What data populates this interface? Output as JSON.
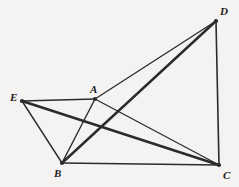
{
  "figure": {
    "canvas": {
      "width": 239,
      "height": 187
    },
    "background_color": "#f4f3f1",
    "stroke_color": "#2b2b2b",
    "label_color": "#1b1b1b",
    "points": [
      {
        "id": "A",
        "label": "A",
        "x": 95,
        "y": 99,
        "label_x": 90,
        "label_y": 84
      },
      {
        "id": "B",
        "label": "B",
        "x": 62,
        "y": 163,
        "label_x": 54,
        "label_y": 168
      },
      {
        "id": "C",
        "label": "C",
        "x": 219,
        "y": 165,
        "label_x": 223,
        "label_y": 170
      },
      {
        "id": "D",
        "label": "D",
        "x": 216,
        "y": 21,
        "label_x": 220,
        "label_y": 6
      },
      {
        "id": "E",
        "label": "E",
        "x": 22,
        "y": 101,
        "label_x": 10,
        "label_y": 92
      }
    ],
    "segments": [
      {
        "id": "EA",
        "from": "E",
        "to": "A",
        "width": 1.6
      },
      {
        "id": "EB",
        "from": "E",
        "to": "B",
        "width": 1.4
      },
      {
        "id": "EC",
        "from": "E",
        "to": "C",
        "width": 2.6
      },
      {
        "id": "AB",
        "from": "A",
        "to": "B",
        "width": 1.4
      },
      {
        "id": "AC",
        "from": "A",
        "to": "C",
        "width": 1.3
      },
      {
        "id": "AD",
        "from": "A",
        "to": "D",
        "width": 1.3
      },
      {
        "id": "BC",
        "from": "B",
        "to": "C",
        "width": 1.5
      },
      {
        "id": "BD",
        "from": "B",
        "to": "D",
        "width": 2.4
      },
      {
        "id": "DC",
        "from": "D",
        "to": "C",
        "width": 1.6
      }
    ],
    "vertex_dot_radius": 2.1
  }
}
